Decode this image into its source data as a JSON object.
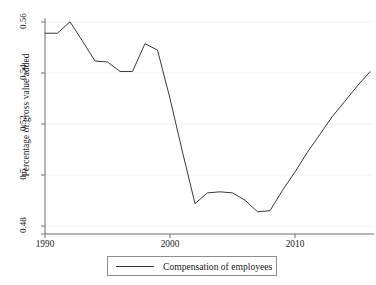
{
  "chart_data": {
    "type": "line",
    "title": "",
    "xlabel": "",
    "ylabel": "Percentage of gross value added",
    "xlim": [
      1990,
      2016
    ],
    "ylim": [
      0.48,
      0.565
    ],
    "grid": true,
    "grid_axis": "y",
    "legend_position": "below",
    "x_ticks": [
      1990,
      2000,
      2010
    ],
    "x_tick_labels": [
      "1990",
      "2000",
      "2010"
    ],
    "y_ticks": [
      0.48,
      0.5,
      0.52,
      0.54,
      0.56
    ],
    "y_tick_labels": [
      "0.48",
      "0.5",
      "0.52",
      "0.54",
      "0.56"
    ],
    "series": [
      {
        "name": "Compensation of employees",
        "color": "#3a3a3a",
        "x": [
          1990,
          1991,
          1992,
          1993,
          1994,
          1995,
          1996,
          1997,
          1998,
          1999,
          2000,
          2001,
          2002,
          2003,
          2004,
          2005,
          2006,
          2007,
          2008,
          2009,
          2010,
          2011,
          2012,
          2013,
          2014,
          2015,
          2016
        ],
        "values": [
          0.5556,
          0.5556,
          0.5601,
          0.5525,
          0.5447,
          0.5443,
          0.5406,
          0.5406,
          0.5515,
          0.549,
          0.53,
          0.509,
          0.4888,
          0.493,
          0.4934,
          0.493,
          0.4901,
          0.4856,
          0.486,
          0.494,
          0.5012,
          0.509,
          0.516,
          0.523,
          0.529,
          0.535,
          0.5405
        ]
      }
    ]
  },
  "axis": {
    "y_title": "Percentage of gross value added"
  },
  "legend": {
    "entries": [
      {
        "label": "Compensation of employees"
      }
    ]
  }
}
